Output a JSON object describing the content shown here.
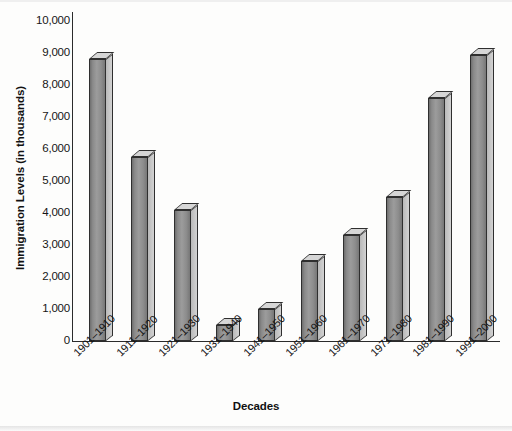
{
  "chart_data": {
    "type": "bar",
    "title": "",
    "xlabel": "Decades",
    "ylabel": "Immigration Levels (in thousands)",
    "ylim": [
      0,
      10000
    ],
    "ytick_labels": [
      "10,000",
      "9,000",
      "8,000",
      "7,000",
      "6,000",
      "5,000",
      "4,000",
      "3,000",
      "2,000",
      "1,000",
      "0"
    ],
    "ytick_values": [
      10000,
      9000,
      8000,
      7000,
      6000,
      5000,
      4000,
      3000,
      2000,
      1000,
      0
    ],
    "grid": false,
    "legend": false,
    "categories": [
      "1901–1910",
      "1911–1920",
      "1921–1930",
      "1931–1940",
      "1941–1950",
      "1951–1960",
      "1961–1970",
      "1971–1980",
      "1981–1990",
      "1991–2000"
    ],
    "values": [
      8800,
      5750,
      4100,
      500,
      1000,
      2500,
      3300,
      4500,
      7600,
      8950
    ],
    "series": [
      {
        "name": "Immigration Levels",
        "values": [
          8800,
          5750,
          4100,
          500,
          1000,
          2500,
          3300,
          4500,
          7600,
          8950
        ]
      }
    ],
    "bar_style": "3d-column",
    "colors": {
      "bar_face": "#9c9c9c",
      "bar_top": "#d6d6d6",
      "bar_side": "#c6c6c6",
      "bar_outline": "#2f2f2f",
      "axis": "#2b2b2b",
      "text": "#131313",
      "background": "#fdfdfc"
    }
  }
}
